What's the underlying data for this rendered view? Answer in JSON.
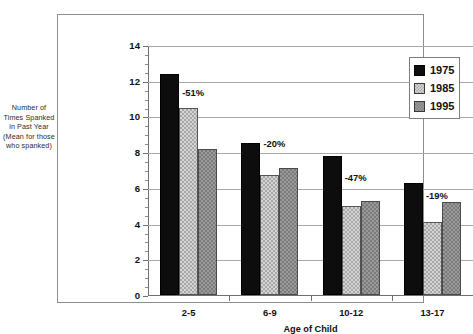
{
  "chart_data": {
    "type": "bar",
    "title": "",
    "subtitle": "",
    "xlabel": "Age of Child",
    "ylabel": "Number of Times Spanked in Past Year (Mean for those who spanked)",
    "categories": [
      "2-5",
      "6-9",
      "10-12",
      "13-17"
    ],
    "series": [
      {
        "name": "1975",
        "values": [
          12.4,
          8.5,
          7.8,
          6.25
        ]
      },
      {
        "name": "1985",
        "values": [
          10.5,
          6.7,
          5.0,
          4.1
        ]
      },
      {
        "name": "1995",
        "values": [
          8.2,
          7.1,
          5.25,
          5.2
        ]
      }
    ],
    "ylim": [
      0,
      14
    ],
    "yticks": [
      0,
      2,
      4,
      6,
      8,
      10,
      12,
      14
    ],
    "ytick_labels": [
      "0",
      "2",
      "4",
      "6",
      "8",
      "10",
      "12",
      "14"
    ],
    "y_minor_tick_interval": 0.5,
    "grid": "horizontal",
    "legend_position": "top-right",
    "annotations": [
      {
        "text": "-51%",
        "category": "2-5",
        "value": 11.35
      },
      {
        "text": "-20%",
        "category": "6-9",
        "value": 8.5
      },
      {
        "text": "-47%",
        "category": "10-12",
        "value": 6.6
      },
      {
        "text": "-19%",
        "category": "13-17",
        "value": 5.6
      }
    ],
    "colors": {
      "series_1975": "#0d0d0d",
      "series_1985": "#d4d4d4",
      "series_1995": "#9a9a9a",
      "gridline": "#a9a9a9",
      "axis": "#6f6f6f",
      "frame": "#8e8e8e",
      "background": "#ffffff",
      "text": "#111111"
    }
  },
  "axis": {
    "y_title": "Number of Times Spanked in Past Year (Mean for those who spanked)",
    "x_title": "Age of Child"
  },
  "legend": {
    "items": [
      {
        "label": "1975",
        "swatch": "legend-swatch-1975"
      },
      {
        "label": "1985",
        "swatch": "legend-swatch-1985"
      },
      {
        "label": "1995",
        "swatch": "legend-swatch-1995"
      }
    ]
  }
}
